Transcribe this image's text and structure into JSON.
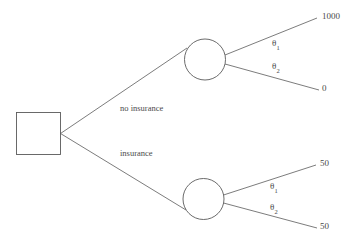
{
  "diagram": {
    "type": "decision-tree",
    "title": "",
    "background_color": "#ffffff",
    "line_color": "#5a5a5a",
    "text_color": "#4a4a4a",
    "decision_node": {
      "shape": "square",
      "label": ""
    },
    "branches": [
      {
        "id": "no-insurance",
        "label": "no insurance",
        "chance_node": {
          "shape": "circle",
          "label": ""
        },
        "outcomes": [
          {
            "probability_label": "θ",
            "probability_subscript": "1",
            "payoff": "1000"
          },
          {
            "probability_label": "θ",
            "probability_subscript": "2",
            "payoff": "0"
          }
        ]
      },
      {
        "id": "insurance",
        "label": "insurance",
        "chance_node": {
          "shape": "circle",
          "label": ""
        },
        "outcomes": [
          {
            "probability_label": "θ",
            "probability_subscript": "1",
            "payoff": "50"
          },
          {
            "probability_label": "θ",
            "probability_subscript": "2",
            "payoff": "50"
          }
        ]
      }
    ]
  }
}
